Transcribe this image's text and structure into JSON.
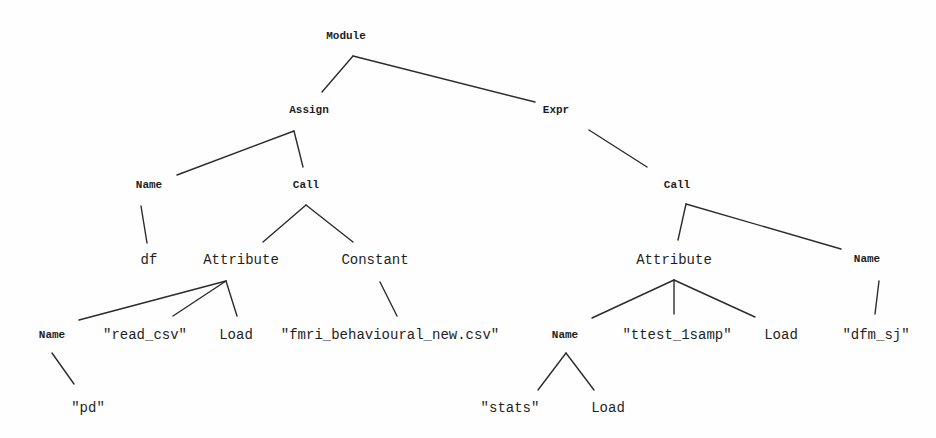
{
  "diagram": {
    "type": "abstract-syntax-tree",
    "nodes": [
      {
        "id": "module",
        "label": "Module",
        "kind": "type",
        "x": 346,
        "y": 36
      },
      {
        "id": "assign",
        "label": "Assign",
        "kind": "type",
        "x": 309,
        "y": 110
      },
      {
        "id": "expr",
        "label": "Expr",
        "kind": "type",
        "x": 556,
        "y": 110
      },
      {
        "id": "name_df",
        "label": "Name",
        "kind": "type",
        "x": 149,
        "y": 185
      },
      {
        "id": "call_left",
        "label": "Call",
        "kind": "type",
        "x": 306,
        "y": 185
      },
      {
        "id": "call_right",
        "label": "Call",
        "kind": "type",
        "x": 677,
        "y": 185
      },
      {
        "id": "df",
        "label": "df",
        "kind": "value",
        "x": 149,
        "y": 260
      },
      {
        "id": "attribute_left",
        "label": "Attribute",
        "kind": "value",
        "x": 241,
        "y": 260
      },
      {
        "id": "constant",
        "label": "Constant",
        "kind": "value",
        "x": 375,
        "y": 260
      },
      {
        "id": "attribute_right",
        "label": "Attribute",
        "kind": "value",
        "x": 674,
        "y": 260
      },
      {
        "id": "name_dfm",
        "label": "Name",
        "kind": "type",
        "x": 867,
        "y": 259
      },
      {
        "id": "name_pd",
        "label": "Name",
        "kind": "type",
        "x": 52,
        "y": 335
      },
      {
        "id": "read_csv",
        "label": "\"read_csv\"",
        "kind": "value",
        "x": 145,
        "y": 335
      },
      {
        "id": "load_left",
        "label": "Load",
        "kind": "value",
        "x": 236,
        "y": 335
      },
      {
        "id": "csv_file",
        "label": "\"fmri_behavioural_new.csv\"",
        "kind": "value",
        "x": 390,
        "y": 335
      },
      {
        "id": "name_stats",
        "label": "Name",
        "kind": "type",
        "x": 565,
        "y": 335
      },
      {
        "id": "ttest_1samp",
        "label": "\"ttest_1samp\"",
        "kind": "value",
        "x": 677,
        "y": 335
      },
      {
        "id": "load_mid",
        "label": "Load",
        "kind": "value",
        "x": 781,
        "y": 335
      },
      {
        "id": "dfm_sj",
        "label": "\"dfm_sj\"",
        "kind": "value",
        "x": 876,
        "y": 335
      },
      {
        "id": "pd",
        "label": "\"pd\"",
        "kind": "value",
        "x": 88,
        "y": 408
      },
      {
        "id": "stats",
        "label": "\"stats\"",
        "kind": "value",
        "x": 510,
        "y": 408
      },
      {
        "id": "load_right",
        "label": "Load",
        "kind": "value",
        "x": 608,
        "y": 408
      }
    ],
    "edges": [
      {
        "from": "module",
        "to": "assign",
        "x1": 353,
        "y1": 56,
        "x2": 322,
        "y2": 92
      },
      {
        "from": "module",
        "to": "expr",
        "x1": 353,
        "y1": 56,
        "x2": 535,
        "y2": 102
      },
      {
        "from": "assign",
        "to": "name_df",
        "x1": 294,
        "y1": 131,
        "x2": 177,
        "y2": 175
      },
      {
        "from": "assign",
        "to": "call_left",
        "x1": 294,
        "y1": 131,
        "x2": 303,
        "y2": 167
      },
      {
        "from": "name_df",
        "to": "df",
        "x1": 141,
        "y1": 206,
        "x2": 147,
        "y2": 243
      },
      {
        "from": "call_left",
        "to": "attribute_left",
        "x1": 306,
        "y1": 205,
        "x2": 263,
        "y2": 242
      },
      {
        "from": "call_left",
        "to": "constant",
        "x1": 306,
        "y1": 205,
        "x2": 353,
        "y2": 242
      },
      {
        "from": "attribute_left",
        "to": "name_pd",
        "x1": 226,
        "y1": 281,
        "x2": 79,
        "y2": 320
      },
      {
        "from": "attribute_left",
        "to": "read_csv",
        "x1": 226,
        "y1": 281,
        "x2": 173,
        "y2": 316
      },
      {
        "from": "attribute_left",
        "to": "load_left",
        "x1": 226,
        "y1": 281,
        "x2": 237,
        "y2": 316
      },
      {
        "from": "constant",
        "to": "csv_file",
        "x1": 380,
        "y1": 282,
        "x2": 397,
        "y2": 316
      },
      {
        "from": "expr",
        "to": "call_right",
        "x1": 589,
        "y1": 130,
        "x2": 647,
        "y2": 167
      },
      {
        "from": "call_right",
        "to": "attribute_right",
        "x1": 686,
        "y1": 204,
        "x2": 678,
        "y2": 240
      },
      {
        "from": "call_right",
        "to": "name_dfm",
        "x1": 686,
        "y1": 204,
        "x2": 841,
        "y2": 249
      },
      {
        "from": "attribute_right",
        "to": "name_stats",
        "x1": 674,
        "y1": 280,
        "x2": 592,
        "y2": 318
      },
      {
        "from": "attribute_right",
        "to": "ttest_1samp",
        "x1": 674,
        "y1": 280,
        "x2": 674,
        "y2": 314
      },
      {
        "from": "attribute_right",
        "to": "load_mid",
        "x1": 674,
        "y1": 280,
        "x2": 755,
        "y2": 317
      },
      {
        "from": "name_dfm",
        "to": "dfm_sj",
        "x1": 879,
        "y1": 281,
        "x2": 875,
        "y2": 314
      },
      {
        "from": "name_pd",
        "to": "pd",
        "x1": 52,
        "y1": 353,
        "x2": 74,
        "y2": 384
      },
      {
        "from": "name_stats",
        "to": "stats",
        "x1": 566,
        "y1": 353,
        "x2": 538,
        "y2": 390
      },
      {
        "from": "name_stats",
        "to": "load_right",
        "x1": 566,
        "y1": 353,
        "x2": 594,
        "y2": 390
      }
    ]
  }
}
